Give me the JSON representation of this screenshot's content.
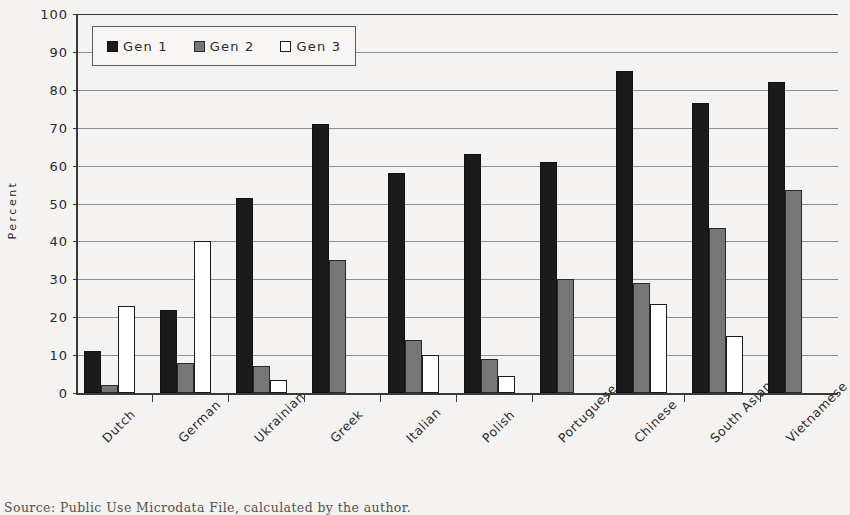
{
  "chart_data": {
    "type": "bar",
    "title": "",
    "xlabel": "",
    "ylabel": "Percent",
    "ylim": [
      0,
      100
    ],
    "ytick_step": 10,
    "yticks": [
      100,
      90,
      80,
      70,
      60,
      50,
      40,
      30,
      20,
      10,
      0
    ],
    "grid": true,
    "legend_position": "top-left-inside",
    "categories": [
      "Dutch",
      "German",
      "Ukrainian",
      "Greek",
      "Italian",
      "Polish",
      "Portuguese",
      "Chinese",
      "South Asian",
      "Vietnamese"
    ],
    "series": [
      {
        "name": "Gen 1",
        "color": "#1b1b1b",
        "values": [
          11,
          22,
          51.5,
          71,
          58,
          63,
          61,
          85,
          76.5,
          82
        ]
      },
      {
        "name": "Gen 2",
        "color": "#767676",
        "values": [
          2,
          8,
          7,
          35,
          14,
          9,
          30,
          29,
          43.5,
          53.5
        ]
      },
      {
        "name": "Gen 3",
        "color": "#ffffff",
        "values": [
          23,
          40,
          3.5,
          null,
          10,
          4.5,
          null,
          23.5,
          15,
          null
        ]
      }
    ]
  },
  "legend": {
    "entries": [
      {
        "label": "Gen 1",
        "swatch": "gen1"
      },
      {
        "label": "Gen 2",
        "swatch": "gen2"
      },
      {
        "label": "Gen 3",
        "swatch": "gen3"
      }
    ]
  },
  "axis": {
    "y_title": "Percent"
  },
  "footer": {
    "source_note": "Source:      Public Use Microdata File, calculated by the author."
  }
}
